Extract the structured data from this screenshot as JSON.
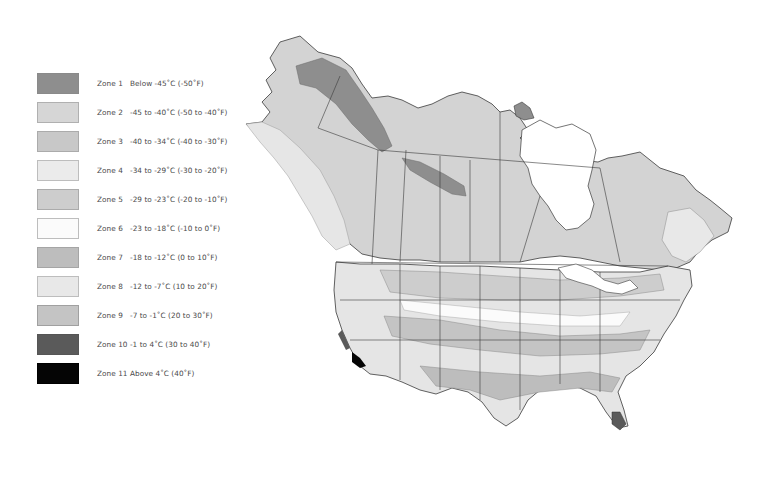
{
  "legend": {
    "items": [
      {
        "zone": "Zone 1",
        "range": "Below -45˚C (-50˚F)",
        "color": "#8e8e8e",
        "border": "#8a8a8a"
      },
      {
        "zone": "Zone 2",
        "range": "-45 to -40˚C (-50 to -40˚F)",
        "color": "#d6d6d6",
        "border": "#b0b0b0"
      },
      {
        "zone": "Zone 3",
        "range": "-40 to -34˚C (-40 to -30˚F)",
        "color": "#c8c8c8",
        "border": "#ababab"
      },
      {
        "zone": "Zone 4",
        "range": "-34 to -29˚C (-30 to -20˚F)",
        "color": "#ebebeb",
        "border": "#bdbdbd"
      },
      {
        "zone": "Zone 5",
        "range": "-29 to -23˚C (-20 to -10˚F)",
        "color": "#cdcdcd",
        "border": "#ababab"
      },
      {
        "zone": "Zone 6",
        "range": "-23 to -18˚C (-10 to 0˚F)",
        "color": "#fbfbfb",
        "border": "#bdbdbd"
      },
      {
        "zone": "Zone 7",
        "range": "-18 to -12˚C (0 to 10˚F)",
        "color": "#bdbdbd",
        "border": "#a5a5a5"
      },
      {
        "zone": "Zone 8",
        "range": "-12 to -7˚C (10 to 20˚F)",
        "color": "#e8e8e8",
        "border": "#bdbdbd"
      },
      {
        "zone": "Zone 9",
        "range": "-7 to -1˚C (20 to 30˚F)",
        "color": "#c4c4c4",
        "border": "#a0a0a0"
      },
      {
        "zone": "Zone 10",
        "range": "-1 to 4˚C (30 to 40˚F)",
        "color": "#5a5a5a",
        "border": "#555555"
      },
      {
        "zone": "Zone 11",
        "range": "Above 4˚C (40˚F)",
        "color": "#050505",
        "border": "#000000"
      }
    ]
  },
  "map": {
    "region": "North America (Canada and United States)",
    "background": "#ffffff",
    "outline_color": "#3a3a3a",
    "base_fill": "#d3d3d3"
  }
}
